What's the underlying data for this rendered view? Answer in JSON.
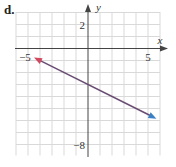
{
  "panel_label": "d.",
  "chart_data": {
    "type": "line",
    "title": "",
    "xlabel": "x",
    "ylabel": "y",
    "xlim": [
      -6,
      6
    ],
    "ylim": [
      -9,
      3
    ],
    "grid": true,
    "x_tick_labels": [
      {
        "value": -5,
        "label": "−5"
      },
      {
        "value": 5,
        "label": "5"
      }
    ],
    "y_tick_labels": [
      {
        "value": 2,
        "label": "2"
      },
      {
        "value": -8,
        "label": "−8"
      }
    ],
    "series": [
      {
        "name": "line",
        "equation": "y = -x/2 - 3",
        "slope": -0.5,
        "intercept": -3,
        "x": [
          -4.5,
          5.7
        ],
        "y": [
          -0.75,
          -5.85
        ],
        "arrow_start_color": "#d2485f",
        "arrow_end_color": "#3b7fc4",
        "line_color": "#6b4d74"
      }
    ]
  },
  "colors": {
    "grid": "#d9d9d9",
    "axis": "#444444",
    "text": "#333333"
  }
}
